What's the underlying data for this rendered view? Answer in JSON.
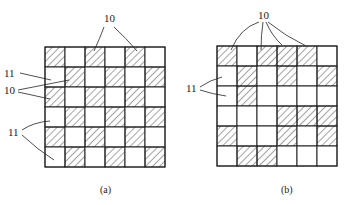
{
  "figures": [
    {
      "id": "a",
      "caption": "(a)",
      "rows": 6,
      "cols": 6,
      "origin": [
        45,
        47
      ],
      "cell": 20,
      "pattern": [
        [
          1,
          0,
          1,
          0,
          1,
          0
        ],
        [
          0,
          1,
          0,
          1,
          0,
          1
        ],
        [
          1,
          0,
          1,
          0,
          1,
          0
        ],
        [
          0,
          1,
          0,
          1,
          0,
          1
        ],
        [
          1,
          0,
          1,
          0,
          1,
          0
        ],
        [
          0,
          1,
          0,
          1,
          0,
          1
        ]
      ],
      "labels": [
        {
          "text": "10",
          "x": 104,
          "y": 22
        },
        {
          "text": "11",
          "x": 4,
          "y": 77
        },
        {
          "text": "10",
          "x": 4,
          "y": 94
        },
        {
          "text": "11",
          "x": 8,
          "y": 136
        }
      ]
    },
    {
      "id": "b",
      "caption": "(b)",
      "rows": 6,
      "cols": 6,
      "origin": [
        217,
        46
      ],
      "cell": 20,
      "pattern": [
        [
          1,
          0,
          1,
          1,
          1,
          0
        ],
        [
          0,
          1,
          0,
          1,
          0,
          1
        ],
        [
          0,
          1,
          0,
          0,
          0,
          0
        ],
        [
          0,
          0,
          0,
          1,
          1,
          1
        ],
        [
          1,
          0,
          0,
          1,
          0,
          1
        ],
        [
          0,
          1,
          1,
          0,
          0,
          0
        ]
      ],
      "labels": [
        {
          "text": "10",
          "x": 258,
          "y": 19
        },
        {
          "text": "11",
          "x": 186,
          "y": 92
        }
      ]
    }
  ],
  "legend": {
    "hatched_cell": "10",
    "blank_cell": "11"
  }
}
